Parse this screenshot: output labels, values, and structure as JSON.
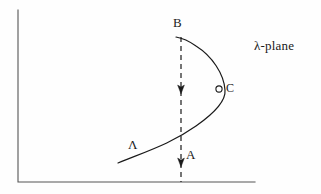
{
  "figure": {
    "background_color": "#fefefe",
    "stroke_color": "#1a1a1a",
    "axes": {
      "name": "quadrant-axes",
      "vertical": {
        "x": 18,
        "y_top": 10,
        "y_bottom": 182
      },
      "horizontal": {
        "y": 182,
        "x_left": 18,
        "x_right": 255
      },
      "line_width": 1.1
    },
    "labels": {
      "point_b": "B",
      "point_c": "C",
      "contour_a": "A",
      "contour_lambda": "Λ",
      "plane": "λ-plane"
    },
    "curve": {
      "name": "branch-cut-contour",
      "description": "solid curve from lower-left through rightward bulge up to B",
      "path": "M 118 163 C 150 150, 172 143, 196 126 C 216 112, 226 100, 225 90 C 224 74, 212 56, 196 46 C 189 41, 182 38, 176 37",
      "line_width": 1.2
    },
    "marker_c": {
      "name": "open-circle-marker-c",
      "cx": 219,
      "cy": 89,
      "r": 3.1,
      "fill": "#fefefe",
      "stroke": "#1a1a1a"
    },
    "dashed_line": {
      "name": "dashed-integration-path",
      "x": 181,
      "y_top": 37,
      "y_bottom": 182,
      "dash_pattern": "5,4",
      "line_width": 1.2,
      "arrow_direction": "down",
      "arrowheads": [
        {
          "name": "arrowhead-upper",
          "x": 181,
          "y": 92
        },
        {
          "name": "arrowhead-lower",
          "x": 181,
          "y": 165
        }
      ]
    }
  }
}
